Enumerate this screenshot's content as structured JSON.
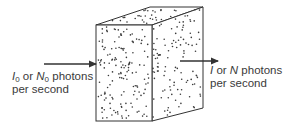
{
  "diagram": {
    "incident": {
      "symbol_1": "I",
      "sub_1": "0",
      "connector": " or ",
      "symbol_2": "N",
      "sub_2": "0",
      "line1_suffix": " photons",
      "line2": "per second"
    },
    "transmitted": {
      "symbol_1": "I",
      "connector": " or ",
      "symbol_2": "N",
      "line1_suffix": " photons",
      "line2": "per second"
    },
    "colors": {
      "line": "#333333",
      "dots": "#3a3a3a",
      "text": "#3a3a3a",
      "background": "#ffffff"
    }
  }
}
